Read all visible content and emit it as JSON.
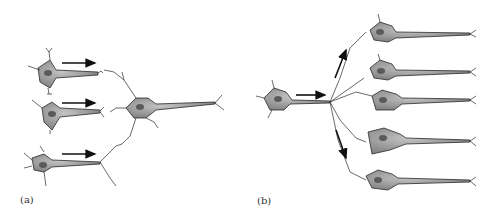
{
  "figure": {
    "panels": [
      {
        "id": "a",
        "label": "(a)",
        "concept": "convergence",
        "presynaptic_neurons": 3,
        "postsynaptic_neurons": 1
      },
      {
        "id": "b",
        "label": "(b)",
        "concept": "divergence",
        "presynaptic_neurons": 1,
        "postsynaptic_neurons": 5
      }
    ]
  },
  "colors": {
    "cell_fill": "#8a8a8a",
    "cell_light": "#b5b5b5",
    "nucleus": "#5a5a5a",
    "stroke": "#2a2a2a",
    "arrow": "#111111",
    "background": "#ffffff"
  }
}
